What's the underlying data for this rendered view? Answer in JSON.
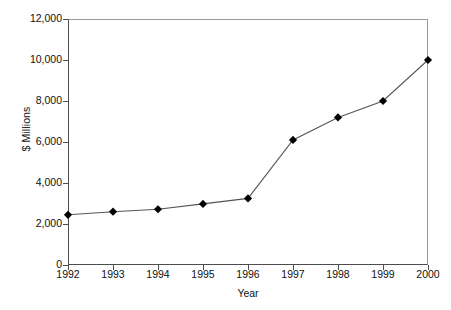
{
  "chart_data": {
    "type": "line",
    "title": "",
    "subtitle": "",
    "xlabel": "Year",
    "ylabel": "$ Millions",
    "categories": [
      "1992",
      "1993",
      "1994",
      "1995",
      "1996",
      "1997",
      "1998",
      "1999",
      "2000"
    ],
    "x": [
      1992,
      1993,
      1994,
      1995,
      1996,
      1997,
      1998,
      1999,
      2000
    ],
    "values": [
      2450,
      2600,
      2720,
      2980,
      3250,
      6100,
      7200,
      8000,
      10000
    ],
    "series": [
      {
        "name": "",
        "values": [
          2450,
          2600,
          2720,
          2980,
          3250,
          6100,
          7200,
          8000,
          10000
        ]
      }
    ],
    "ylim": [
      0,
      12000
    ],
    "ytick_labels": [
      "12,000",
      "10,000",
      "8,000",
      "6,000",
      "4,000",
      "2,000",
      "0"
    ],
    "ytick_values": [
      12000,
      10000,
      8000,
      6000,
      4000,
      2000,
      0
    ],
    "xtick_labels": [
      "1992",
      "1993",
      "1994",
      "1995",
      "1996",
      "1997",
      "1998",
      "1999",
      "2000"
    ],
    "grid": false,
    "legend": false,
    "legend_position": "none",
    "marker": "diamond",
    "marker_color": "#000000",
    "line_color": "#555555",
    "axis_color": "#4d4d4d",
    "background_color": "#ffffff",
    "annotations": []
  }
}
